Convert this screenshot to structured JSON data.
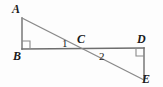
{
  "figure": {
    "type": "geometry-diagram",
    "background_color": "#fdfdfd",
    "stroke_color": "#6e6e6e",
    "label_color": "#1a1a1a",
    "vertices": [
      {
        "name": "A",
        "label": "A",
        "x": 22,
        "y": 18
      },
      {
        "name": "B",
        "label": "B",
        "x": 22,
        "y": 49
      },
      {
        "name": "C",
        "label": "C",
        "x": 84,
        "y": 49
      },
      {
        "name": "D",
        "label": "D",
        "x": 144,
        "y": 48
      },
      {
        "name": "E",
        "label": "E",
        "x": 144,
        "y": 80
      }
    ],
    "segments": [
      {
        "name": "AB",
        "from": "A",
        "to": "B"
      },
      {
        "name": "BD",
        "from": "B",
        "to": "D"
      },
      {
        "name": "DE",
        "from": "D",
        "to": "E"
      },
      {
        "name": "AE",
        "from": "A",
        "to": "E"
      }
    ],
    "right_angles": [
      {
        "name": "right-angle-B",
        "at": "B",
        "marker": "square"
      },
      {
        "name": "right-angle-D",
        "at": "D",
        "marker": "square"
      }
    ],
    "angle_labels": [
      {
        "name": "angle-1",
        "label": "1",
        "at_vertex": "C",
        "position": "above-left"
      },
      {
        "name": "angle-2",
        "label": "2",
        "at_vertex": "C",
        "position": "below-right"
      }
    ]
  }
}
